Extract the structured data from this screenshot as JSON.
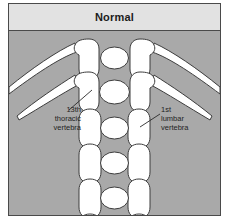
{
  "figure": {
    "title": "Normal",
    "background_color": "#a9a9a9",
    "title_band_color": "#e2e2e2",
    "border_color": "#4a4a4a",
    "bone_color": "#ffffff",
    "bone_outline_color": "#3c3c3c",
    "label_text_color": "#1f1f1f"
  },
  "annotations": {
    "thoracic": {
      "line1": "13th",
      "line2": "thoracic",
      "line3": "vertebra"
    },
    "lumbar": {
      "line1": "1st",
      "line2": "lumbar",
      "line3": "vertebra"
    }
  },
  "anatomy": {
    "vertebrae_count": 6,
    "rib_bearing_vertebrae": 2,
    "lumbar_vertebrae": 4,
    "description": "Dorsal view of thoracolumbar vertebral column with ribs on the 13th thoracic vertebra"
  }
}
